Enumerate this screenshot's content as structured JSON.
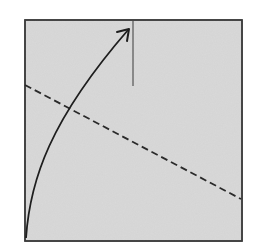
{
  "diagram": {
    "type": "origami-fold-step",
    "paper": {
      "shape": "square",
      "fill": "#d9d9d9",
      "border": "#3a3a3a",
      "x": 25,
      "y": 20,
      "width": 217,
      "height": 221
    },
    "elements": [
      {
        "kind": "fold-arrow",
        "description": "curved arrow from bottom-left corner up to the top edge",
        "color": "#1e1e1e"
      },
      {
        "kind": "reference-line",
        "description": "vertical line hanging from the top edge",
        "color": "#3a3a3a"
      },
      {
        "kind": "valley-fold-line",
        "description": "dashed diagonal fold line from left edge to right edge",
        "color": "#2a2a2a"
      }
    ]
  }
}
